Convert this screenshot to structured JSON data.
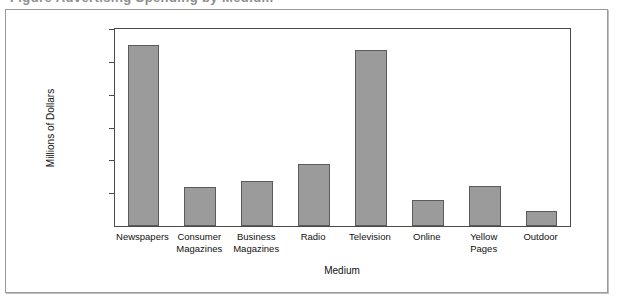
{
  "caption": {
    "sliver_text": "Figure  Advertising Spending by Medium"
  },
  "chart_data": {
    "type": "bar",
    "title": "",
    "xlabel": "Medium",
    "ylabel": "Millions of Dollars",
    "categories": [
      "Newspapers",
      "Consumer\nMagazines",
      "Business\nMagazines",
      "Radio",
      "Television",
      "Online",
      "Yellow\nPages",
      "Outdoor"
    ],
    "values": [
      55000,
      11800,
      13600,
      19000,
      53500,
      7800,
      12200,
      4700
    ],
    "ylim": [
      0,
      60000
    ],
    "yticks": [
      10000,
      20000,
      30000,
      40000,
      50000,
      60000
    ],
    "ytick_labels": [
      "10,000",
      "20,000",
      "30,000",
      "40,000",
      "50,000",
      "60,000"
    ],
    "grid": false,
    "legend": false,
    "bar_color": "#9b9b9b",
    "bar_border_color": "#5b5b5b",
    "axis_color": "#4a4a4a",
    "frame_color": "#9a9a9a",
    "background": "#ffffff"
  }
}
